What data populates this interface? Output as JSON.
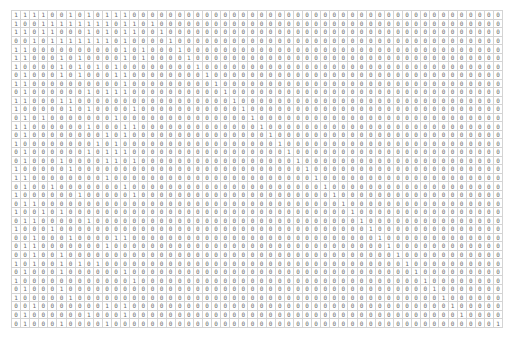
{
  "table": {
    "n_rows": 37,
    "n_cols": 54,
    "rows": [
      "111100101011100000000000000000000000000000000000000000",
      "100111111110110100000000000000000000000000000000000000",
      "110110001010110010000000000000000000000000000000000000",
      "001011111110100001000000000000000000000000000000000000",
      "110000000000101000100000000000000000000000000000000000",
      "110001010000101000010000000000000000000000000000000000",
      "100001010101000000001000000000000000000000000000000000",
      "010001010001100000000100000000000000000000000000000000",
      "110000000000100000000010000000000000000000000000000000",
      "010000001011100000000001000000000000000000000000000000",
      "110001100000000000000000100000000000000000000000000000",
      "100000101000010000000000010000000000000000000000000000",
      "010100000001000000000000001000000000000000000000000000",
      "110000001000110000000000000100000000000000000000000000",
      "010000000010100000000000000010000000000000000000000000",
      "100000000101000000000000000001000000000000000000000000",
      "010000001011100000000000000000100000000000000000000000",
      "010001000011010000000000000000010000000000000000000000",
      "100000100000000000000000000000001000000000000000000000",
      "110000000010000000000000000000000100000000000000000000",
      "010010000000100000000000000000000010000000000000000000",
      "100000010000010000000000000000000001000000000000000000",
      "011000000000000000000000000000000000100000000000000000",
      "100101000000000000000000000000000000010000000000000000",
      "011000001000000000000000000000000000001000000000000000",
      "100010000000000000000000000000000000000100000000000000",
      "001000100001100000000000000000000000000010000000000000",
      "011000000010000000000000000000000000000001000000000000",
      "001001000000000000000000000000000000000000100000000000",
      "101001010100000000000000000000000000000000010000000000",
      "010001000000100000000000000000000000000000001000000000",
      "100000000000010000000000000000000000000000000100000000",
      "010001000000000000000000000000000000000000000010000000",
      "100000100000000000000000000000000000000000000001000000",
      "001000000010100000000000000000000000000000000000100000",
      "010000001000100000000000000000000000000000000000010000",
      "010001000010000000000000000000000000000000000000000001"
    ]
  }
}
